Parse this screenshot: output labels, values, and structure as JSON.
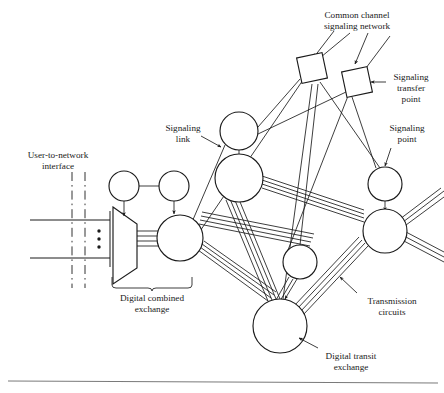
{
  "figure": {
    "background_color": "#ffffff",
    "line_color": "#1b1b1b",
    "text_color": "#1a1a1a",
    "width": 444,
    "height": 393
  },
  "labels": {
    "common_channel_signaling_network": {
      "line1": "Common channel",
      "line2": "signaling network",
      "x": 357,
      "y": 18
    },
    "signaling_transfer_point": {
      "line1": "Signaling",
      "line2": "transfer",
      "line3": "point",
      "x": 410,
      "y": 80
    },
    "signaling_point": {
      "line1": "Signaling",
      "line2": "point",
      "x": 406,
      "y": 130
    },
    "signaling_link": {
      "line1": "Signaling",
      "line2": "link",
      "x": 183,
      "y": 130
    },
    "user_to_network_interface": {
      "line1": "User-to-network",
      "line2": "interface",
      "x": 58,
      "y": 157
    },
    "digital_combined_exchange": {
      "line1": "Digital combined",
      "line2": "exchange",
      "x": 152,
      "y": 293
    },
    "transmission_circuits": {
      "line1": "Transmission",
      "line2": "circuits",
      "x": 391,
      "y": 303
    },
    "digital_transit_exchange": {
      "line1": "Digital transit",
      "line2": "exchange",
      "x": 350,
      "y": 358
    }
  },
  "nodes": {
    "signaling_transfer_points": [
      {
        "name": "stp-left",
        "cx": 312,
        "cy": 68,
        "size": 27,
        "rotation": -12
      },
      {
        "name": "stp-right",
        "cx": 357,
        "cy": 82,
        "size": 26,
        "rotation": -12
      }
    ],
    "circles": [
      {
        "name": "signaling-point-top-left",
        "cx": 124,
        "cy": 186,
        "r": 15
      },
      {
        "name": "signaling-point-top-mid",
        "cx": 174,
        "cy": 186,
        "r": 15
      },
      {
        "name": "digital-combined-exchange",
        "cx": 180,
        "cy": 238,
        "r": 23
      },
      {
        "name": "signaling-point-upper",
        "cx": 239,
        "cy": 131,
        "r": 19
      },
      {
        "name": "exchange-upper",
        "cx": 239,
        "cy": 178,
        "r": 24
      },
      {
        "name": "exchange-middle-small",
        "cx": 300,
        "cy": 262,
        "r": 17
      },
      {
        "name": "signaling-point-right",
        "cx": 385,
        "cy": 184,
        "r": 17
      },
      {
        "name": "exchange-right",
        "cx": 385,
        "cy": 231,
        "r": 22
      },
      {
        "name": "digital-transit-exchange",
        "cx": 280,
        "cy": 326,
        "r": 27
      }
    ]
  },
  "elements": {
    "exchange_trapezoid": "digital-combined-exchange-trapezoid",
    "uni_dashed_lines": 2,
    "uni_horizontal_lines": 2,
    "vertical_dots_count": 3,
    "brace_label": "digital-combined-exchange",
    "bottom_rule": true
  }
}
